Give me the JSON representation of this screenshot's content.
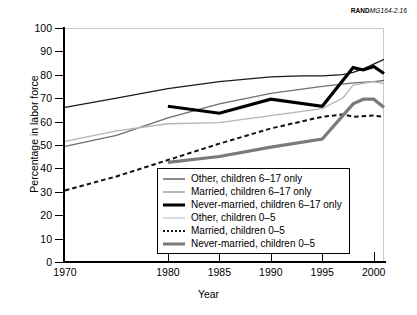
{
  "credit": {
    "bold": "RAND",
    "italic": "MG164-2.16"
  },
  "axes": {
    "ylabel": "Percentage in labor force",
    "xlabel": "Year",
    "yticks": [
      0,
      10,
      20,
      30,
      40,
      50,
      60,
      70,
      80,
      90,
      100
    ],
    "xticks": [
      1970,
      1980,
      1985,
      1990,
      1995,
      2000
    ]
  },
  "legend": [
    {
      "label": "Other, children 6–17 only",
      "style": "thin-dark"
    },
    {
      "label": "Married, children 6–17 only",
      "style": "medium-gray"
    },
    {
      "label": "Never-married, children 6–17 only",
      "style": "thick-black"
    },
    {
      "label": "Other, children 0–5",
      "style": "thin-light"
    },
    {
      "label": "Married, children 0–5",
      "style": "dotted"
    },
    {
      "label": "Never-married, children 0–5",
      "style": "thick-gray"
    }
  ],
  "chart_data": {
    "type": "line",
    "title": "",
    "xlabel": "Year",
    "ylabel": "Percentage in labor force",
    "xlim": [
      1970,
      2001
    ],
    "ylim": [
      0,
      100
    ],
    "grid": false,
    "legend_position": "inside-bottom-center",
    "series": [
      {
        "name": "Other, children 6–17 only",
        "color": "#1a1a1a",
        "width": 1.3,
        "dash": "none",
        "x": [
          1970,
          1975,
          1980,
          1985,
          1990,
          1993,
          1995,
          1997,
          1998,
          1999,
          2000,
          2001
        ],
        "values": [
          66.5,
          70.5,
          74.5,
          77.5,
          79.5,
          80.0,
          80.0,
          80.5,
          81.5,
          83.0,
          85.0,
          87.0
        ]
      },
      {
        "name": "Married, children 6–17 only",
        "color": "#6e6e6e",
        "width": 1.3,
        "dash": "none",
        "x": [
          1970,
          1975,
          1980,
          1985,
          1990,
          1995,
          1998,
          2000,
          2001
        ],
        "values": [
          49.8,
          54.5,
          62.0,
          68.0,
          72.5,
          75.5,
          77.0,
          77.5,
          78.0
        ]
      },
      {
        "name": "Never-married, children 6–17 only",
        "color": "#000000",
        "width": 3.2,
        "dash": "none",
        "x": [
          1980,
          1985,
          1990,
          1995,
          1998,
          1999,
          2000,
          2001
        ],
        "values": [
          67.0,
          64.0,
          70.0,
          67.0,
          83.5,
          82.5,
          84.0,
          81.0
        ]
      },
      {
        "name": "Other, children 0–5",
        "color": "#b5b5b5",
        "width": 1.3,
        "dash": "none",
        "x": [
          1970,
          1975,
          1980,
          1985,
          1990,
          1995,
          1997,
          1998,
          2000,
          2001
        ],
        "values": [
          52.0,
          56.5,
          59.5,
          60.0,
          63.0,
          66.0,
          70.5,
          76.0,
          77.5,
          76.5
        ]
      },
      {
        "name": "Married, children 0–5",
        "color": "#111111",
        "width": 2.0,
        "dash": "dotted",
        "x": [
          1970,
          1975,
          1980,
          1985,
          1990,
          1995,
          1997,
          1998,
          2000,
          2001
        ],
        "values": [
          31.0,
          37.0,
          44.0,
          51.0,
          57.5,
          62.5,
          63.5,
          62.5,
          63.0,
          62.5
        ]
      },
      {
        "name": "Never-married, children 0–5",
        "color": "#7a7a7a",
        "width": 3.2,
        "dash": "none",
        "x": [
          1980,
          1985,
          1990,
          1995,
          1998,
          1999,
          2000,
          2001
        ],
        "values": [
          43.0,
          45.5,
          49.5,
          53.0,
          68.0,
          70.0,
          70.0,
          66.5
        ]
      }
    ]
  }
}
